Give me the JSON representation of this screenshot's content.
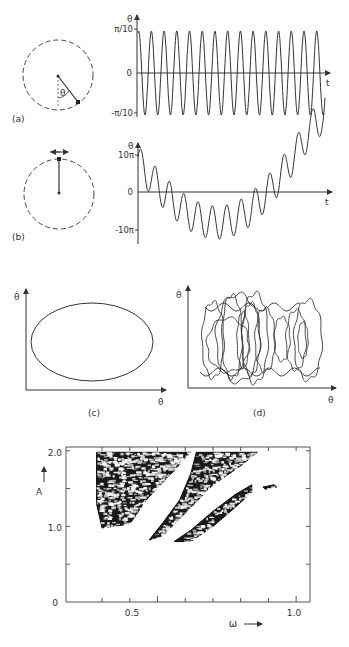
{
  "panels": {
    "a": {
      "label": "(a)",
      "angle_symbol": "θ",
      "y_axis_label": "θ",
      "x_axis_label": "t",
      "y_ticks": [
        "π/10",
        "0",
        "-π/10"
      ],
      "description": "Small-amplitude pendulum oscillation; regular sinusoid"
    },
    "b": {
      "label": "(b)",
      "y_axis_label": "θ",
      "x_axis_label": "t",
      "y_ticks": [
        "10π",
        "0",
        "-10π"
      ],
      "description": "Inverted pendulum, chaotic wandering angle"
    },
    "c": {
      "label": "(c)",
      "y_axis_label": "θ̇",
      "x_axis_label": "θ",
      "description": "Phase portrait: closed ellipse"
    },
    "d": {
      "label": "(d)",
      "y_axis_label": "θ̇",
      "x_axis_label": "θ",
      "description": "Phase portrait: chaotic overlapping loops"
    }
  },
  "chart_data": {
    "type": "scatter",
    "title": "",
    "xlabel": "ω",
    "ylabel": "A",
    "xlim": [
      0.17,
      1.05
    ],
    "ylim": [
      0,
      2.05
    ],
    "x_ticks": [
      "0.5",
      "1.0"
    ],
    "y_ticks": [
      "0",
      "1.0",
      "2.0"
    ],
    "regions": [
      {
        "name": "chaotic-region-left",
        "omega_range": [
          0.27,
          0.62
        ],
        "A_range": [
          1.0,
          2.0
        ]
      },
      {
        "name": "chaotic-band-diagonal-1",
        "omega_range": [
          0.55,
          0.85
        ],
        "A_range": [
          0.8,
          2.0
        ]
      },
      {
        "name": "chaotic-band-diagonal-2",
        "omega_range": [
          0.7,
          0.88
        ],
        "A_range": [
          0.95,
          1.5
        ]
      },
      {
        "name": "chaotic-island",
        "omega_range": [
          0.88,
          0.93
        ],
        "A_range": [
          1.48,
          1.55
        ]
      }
    ],
    "grid": false
  }
}
